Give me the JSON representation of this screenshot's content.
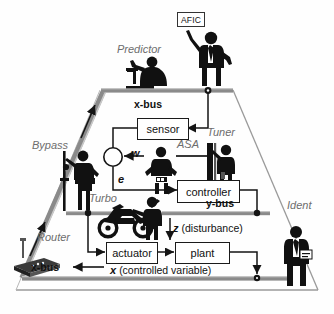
{
  "diagram": {
    "title_sign": "AFIC",
    "roles": {
      "predictor": "Predictor",
      "tuner": "Tuner",
      "bypass": "Bypass",
      "router": "Router",
      "turbo": "Turbo",
      "ident": "Ident",
      "asa": "ASA"
    },
    "blocks": {
      "sensor": "sensor",
      "controller": "controller",
      "actuator": "actuator",
      "plant": "plant"
    },
    "buses": {
      "x_bus_top": "x-bus",
      "x_bus_bottom": "x-bus",
      "y_bus": "y-bus"
    },
    "signals": {
      "w": "w",
      "e": "e",
      "z": "z",
      "z_note": "(disturbance)",
      "x": "x",
      "x_note": "(controlled variable)"
    },
    "icons": {
      "afic_person": "businessman-holding-sign-icon",
      "predictor_person": "person-at-desk-icon",
      "tuner_person": "person-at-rack-icon",
      "bypass_person": "person-with-pole-icon",
      "turbo_person": "person-pushing-motorcycle-icon",
      "router_device": "wireless-router-icon",
      "ident_person": "businessman-icon",
      "asa_person": "person-hands-on-hips-icon",
      "summing_junction": "summing-junction-circle-icon"
    },
    "colors": {
      "bus_gray": "#8a8a8a",
      "outline_gray": "#9a9a9a",
      "line_black": "#141414",
      "label_gray": "#6d6d6d"
    }
  }
}
